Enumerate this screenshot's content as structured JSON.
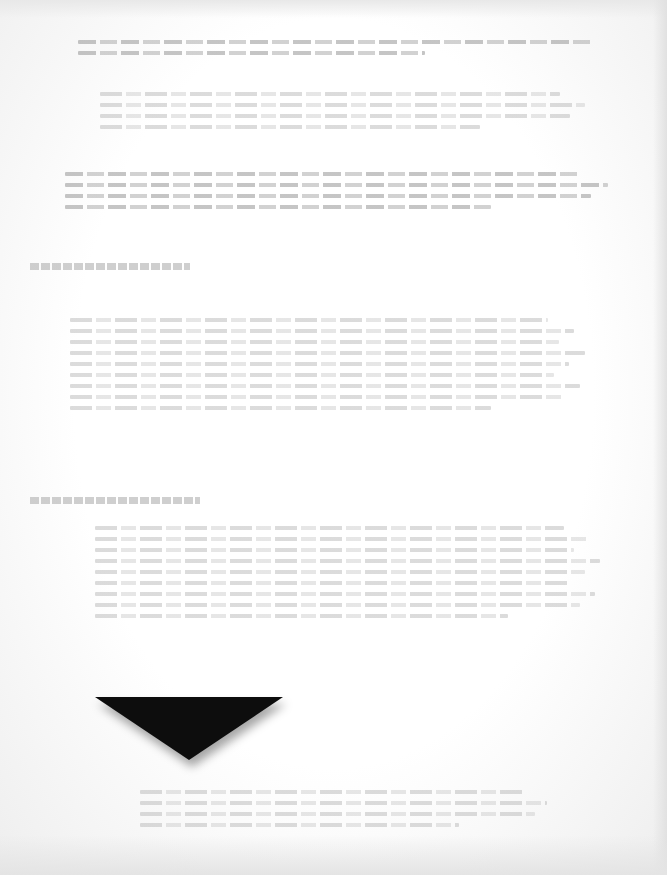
{
  "document": {
    "type": "scanned-page",
    "legibility": "illegible",
    "note": "Text on this scanned page is too faded to transcribe",
    "background_color": "#fbfbfb",
    "ink_color": "#bdbdbd",
    "headings": [
      {
        "id": "heading-1",
        "text": "",
        "x": 30,
        "y": 263,
        "width": 160
      },
      {
        "id": "heading-2",
        "text": "",
        "x": 30,
        "y": 497,
        "width": 170
      }
    ],
    "paragraphs": [
      {
        "id": "para-top-1",
        "x": 78,
        "y": 40,
        "width": 560,
        "lines": 2,
        "dark": true
      },
      {
        "id": "para-top-2",
        "x": 100,
        "y": 92,
        "width": 500,
        "lines": 4,
        "dark": false
      },
      {
        "id": "para-top-3",
        "x": 65,
        "y": 172,
        "width": 560,
        "lines": 4,
        "dark": true
      },
      {
        "id": "para-mid",
        "x": 70,
        "y": 318,
        "width": 520,
        "lines": 9,
        "dark": false
      },
      {
        "id": "para-lower",
        "x": 95,
        "y": 526,
        "width": 510,
        "lines": 9,
        "dark": false
      },
      {
        "id": "para-bottom",
        "x": 140,
        "y": 790,
        "width": 420,
        "lines": 4,
        "dark": false
      }
    ]
  },
  "graphic": {
    "shape": "downward-triangle",
    "color": "#0d0d0d",
    "left": 95,
    "top": 697,
    "width": 188,
    "height": 63
  }
}
